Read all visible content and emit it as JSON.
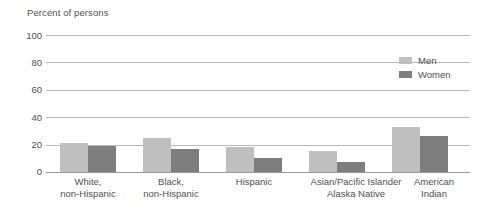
{
  "chart_data": {
    "type": "bar",
    "title": "Percent of persons",
    "xlabel": "",
    "ylabel": "Percent of persons",
    "ylim": [
      0,
      100
    ],
    "yticks": [
      0,
      20,
      40,
      60,
      80,
      100
    ],
    "grid": true,
    "legend_position": "top-right",
    "categories": [
      "White,\nnon-Hispanic",
      "Black,\nnon-Hispanic",
      "Hispanic",
      "Asian/Pacific Islander\nAlaska Native",
      "American\nIndian"
    ],
    "category_lines": [
      {
        "line1": "White,",
        "line2": "non-Hispanic"
      },
      {
        "line1": "Black,",
        "line2": "non-Hispanic"
      },
      {
        "line1": "Hispanic",
        "line2": ""
      },
      {
        "line1": "Asian/Pacific Islander",
        "line2": "Alaska Native"
      },
      {
        "line1": "American",
        "line2": "Indian"
      }
    ],
    "series": [
      {
        "name": "Men",
        "color": "#c0c0c0",
        "values": [
          21,
          25,
          18,
          15,
          33
        ]
      },
      {
        "name": "Women",
        "color": "#7e7e7e",
        "values": [
          19,
          17,
          10,
          7,
          26
        ]
      }
    ]
  },
  "legend": {
    "items": [
      {
        "label": "Men"
      },
      {
        "label": "Women"
      }
    ]
  },
  "axis": {
    "title": "Percent of persons",
    "ticks": [
      "100",
      "80",
      "60",
      "40",
      "20",
      "0"
    ]
  },
  "colors": {
    "men": "#c0c0c0",
    "women": "#7e7e7e",
    "gridline": "#b9b9b9",
    "text": "#4f4f4f",
    "background": "#ffffff"
  }
}
